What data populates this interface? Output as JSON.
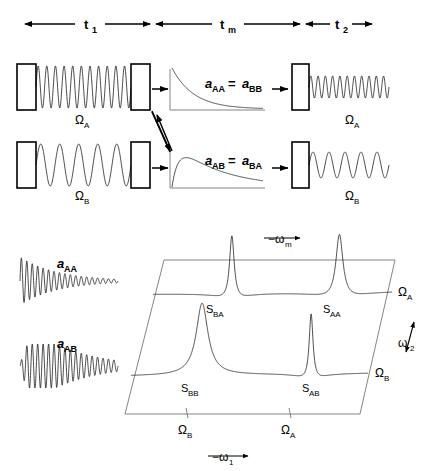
{
  "figure": {
    "title_type": "nmr-2d-exchange-pulse-sequence-and-spectrum",
    "background_color": "#ffffff",
    "line_color": "#000000"
  },
  "timeline": {
    "segments": [
      {
        "id": "t1",
        "label": "t",
        "subscript": "1",
        "x_start": 25,
        "x_end": 150
      },
      {
        "id": "tm",
        "label": "t",
        "subscript": "m",
        "x_start": 156,
        "x_end": 300
      },
      {
        "id": "t2",
        "label": "t",
        "subscript": "2",
        "x_start": 306,
        "x_end": 372
      }
    ]
  },
  "rows": [
    {
      "id": "row-a",
      "evolution_label": "Ω",
      "evolution_subscript": "A",
      "evolution_frequency": 11,
      "mixing_curve_label": "a",
      "mixing_curve_sub_left": "AA",
      "mixing_curve_equals": "=",
      "mixing_curve_sub_right": "BB",
      "mixing_curve_shape": "decay",
      "detection_label": "Ω",
      "detection_subscript": "A",
      "detection_frequency": 11
    },
    {
      "id": "row-b",
      "evolution_label": "Ω",
      "evolution_subscript": "B",
      "evolution_frequency": 5,
      "mixing_curve_label": "a",
      "mixing_curve_sub_left": "AB",
      "mixing_curve_equals": "=",
      "mixing_curve_sub_right": "BA",
      "mixing_curve_shape": "rise-decay",
      "detection_label": "Ω",
      "detection_subscript": "B",
      "detection_frequency": 5
    }
  ],
  "fids": [
    {
      "id": "fid-aa",
      "label": "a",
      "subscript": "AA",
      "envelope": "decay",
      "cycles": 18
    },
    {
      "id": "fid-ab",
      "label": "a",
      "subscript": "AB",
      "envelope": "rise-decay",
      "cycles": 18
    }
  ],
  "spectrum": {
    "type": "2d-contour-stacked",
    "axes": {
      "horizontal": {
        "label": "−ω",
        "subscript": "1",
        "arrow": "→"
      },
      "depth": {
        "label": "−ω",
        "subscript": "m",
        "arrow": "→"
      },
      "vertical": {
        "label": "ω",
        "subscript": "2"
      }
    },
    "bottom_ticks": [
      {
        "label": "Ω",
        "subscript": "B",
        "x": 186
      },
      {
        "label": "Ω",
        "subscript": "A",
        "x": 289
      }
    ],
    "traces": [
      {
        "id": "trace-omega-a",
        "row_label": "Ω",
        "row_subscript": "A",
        "peaks": [
          {
            "name": "S",
            "subscript": "BA",
            "position": 0.33,
            "height": 1.0,
            "width": 0.012,
            "phase": "dispersive-neg"
          },
          {
            "name": "S",
            "subscript": "AA",
            "position": 0.78,
            "height": 1.0,
            "width": 0.018,
            "phase": "dispersive-neg"
          }
        ]
      },
      {
        "id": "trace-omega-b",
        "row_label": "Ω",
        "row_subscript": "B",
        "peaks": [
          {
            "name": "S",
            "subscript": "BB",
            "position": 0.3,
            "height": 1.0,
            "width": 0.03,
            "phase": "absorptive"
          },
          {
            "name": "S",
            "subscript": "AB",
            "position": 0.76,
            "height": 0.95,
            "width": 0.01,
            "phase": "dispersive-neg"
          }
        ]
      }
    ]
  }
}
